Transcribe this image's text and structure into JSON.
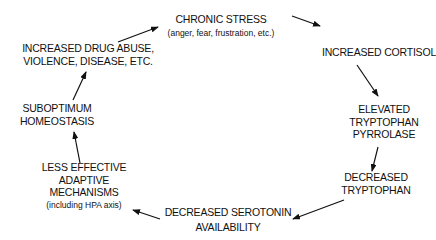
{
  "diagram": {
    "type": "cycle",
    "nodes": [
      {
        "id": "chronic_stress",
        "lines": [
          "CHRONIC STRESS"
        ],
        "sub": "(anger,  fear,  frustration,  etc.)"
      },
      {
        "id": "increased_cortisol",
        "lines": [
          "INCREASED CORTISOL"
        ],
        "sub": ""
      },
      {
        "id": "elevated_tp",
        "lines": [
          "ELEVATED",
          "TRYPTOPHAN",
          "PYRROLASE"
        ],
        "sub": ""
      },
      {
        "id": "decreased_trp",
        "lines": [
          "DECREASED",
          "TRYPTOPHAN"
        ],
        "sub": ""
      },
      {
        "id": "decreased_serotonin",
        "lines": [
          "DECREASED SEROTONIN",
          "AVAILABILITY"
        ],
        "sub": ""
      },
      {
        "id": "less_effective",
        "lines": [
          "LESS EFFECTIVE",
          "ADAPTIVE",
          "MECHANISMS"
        ],
        "sub": "(including HPA axis)"
      },
      {
        "id": "suboptimum",
        "lines": [
          "SUBOPTIMUM",
          "HOMEOSTASIS"
        ],
        "sub": ""
      },
      {
        "id": "increased_drug",
        "lines": [
          "INCREASED DRUG ABUSE,",
          "VIOLENCE, DISEASE, ETC."
        ],
        "sub": ""
      }
    ],
    "edges": [
      {
        "from": "increased_drug",
        "to": "chronic_stress"
      },
      {
        "from": "chronic_stress",
        "to": "increased_cortisol"
      },
      {
        "from": "increased_cortisol",
        "to": "elevated_tp"
      },
      {
        "from": "elevated_tp",
        "to": "decreased_trp"
      },
      {
        "from": "decreased_trp",
        "to": "decreased_serotonin"
      },
      {
        "from": "decreased_serotonin",
        "to": "less_effective"
      },
      {
        "from": "less_effective",
        "to": "suboptimum"
      },
      {
        "from": "suboptimum",
        "to": "increased_drug"
      }
    ],
    "colors": {
      "ink": "#111111",
      "background": "#ffffff"
    }
  }
}
